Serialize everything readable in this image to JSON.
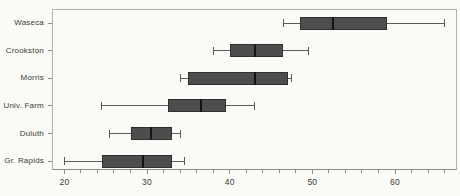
{
  "figure": {
    "kind": "statistical-boxplot-figure"
  },
  "chart_data": {
    "type": "boxplot",
    "orientation": "horizontal",
    "title": "",
    "xlabel": "",
    "ylabel": "",
    "categories": [
      "Waseca",
      "Crookston",
      "Morris",
      "Univ. Farm",
      "Duluth",
      "Gr. Rapids"
    ],
    "boxes": [
      {
        "label": "Waseca",
        "min": 46.5,
        "q1": 48.5,
        "median": 52.5,
        "q3": 59.0,
        "max": 66.0
      },
      {
        "label": "Crookston",
        "min": 38.0,
        "q1": 40.0,
        "median": 43.0,
        "q3": 46.5,
        "max": 49.5
      },
      {
        "label": "Morris",
        "min": 34.0,
        "q1": 35.0,
        "median": 43.0,
        "q3": 47.0,
        "max": 47.5
      },
      {
        "label": "Univ. Farm",
        "min": 24.5,
        "q1": 32.5,
        "median": 36.5,
        "q3": 39.5,
        "max": 43.0
      },
      {
        "label": "Duluth",
        "min": 25.5,
        "q1": 28.0,
        "median": 30.5,
        "q3": 33.0,
        "max": 34.0
      },
      {
        "label": "Gr. Rapids",
        "min": 20.0,
        "q1": 24.5,
        "median": 29.5,
        "q3": 33.0,
        "max": 34.5
      }
    ],
    "xlim": [
      18.5,
      67.5
    ],
    "xticks": [
      20,
      30,
      40,
      50,
      60
    ],
    "minor_tick_step": 2,
    "grid": false,
    "legend": "none"
  },
  "colors": {
    "background": "#fafaf6",
    "box_fill": "#4e4e4e",
    "box_border": "#2f2f2f",
    "median_line": "#141414",
    "whisker": "#5a5a5a",
    "frame": "#b4b2ac",
    "tick": "#8d8d88",
    "label_text": "#3a3a3a"
  }
}
